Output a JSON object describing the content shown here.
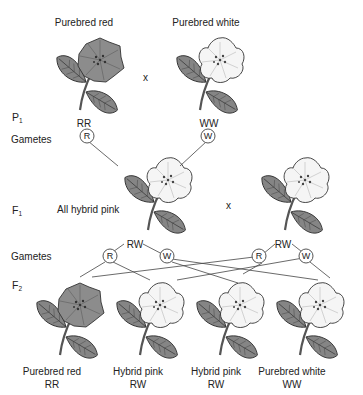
{
  "colors": {
    "red_flower": "#8a8a8a",
    "white_flower": "#f4f4f4",
    "leaf": "#7d7d7d",
    "line": "#444444"
  },
  "generations": {
    "p1": {
      "letter": "P",
      "sub": "1"
    },
    "f1": {
      "letter": "F",
      "sub": "1"
    },
    "f2": {
      "letter": "F",
      "sub": "2"
    }
  },
  "gametes_label_top": "Gametes",
  "gametes_label_bottom": "Gametes",
  "cross_symbol_top": "x",
  "cross_symbol_middle": "x",
  "parents": [
    {
      "title": "Purebred red",
      "genotype": "RR",
      "gamete": "R",
      "color": "red"
    },
    {
      "title": "Purebred white",
      "genotype": "WW",
      "gamete": "W",
      "color": "white"
    }
  ],
  "f1": {
    "label": "All hybrid pink",
    "plants": [
      {
        "genotype": "RW",
        "gametes": [
          "R",
          "W"
        ]
      },
      {
        "genotype": "RW",
        "gametes": [
          "R",
          "W"
        ]
      }
    ]
  },
  "f2": [
    {
      "phenotype": "Purebred red",
      "genotype": "RR",
      "color": "red"
    },
    {
      "phenotype": "Hybrid pink",
      "genotype": "RW",
      "color": "white"
    },
    {
      "phenotype": "Hybrid pink",
      "genotype": "RW",
      "color": "white"
    },
    {
      "phenotype": "Purebred white",
      "genotype": "WW",
      "color": "white"
    }
  ]
}
